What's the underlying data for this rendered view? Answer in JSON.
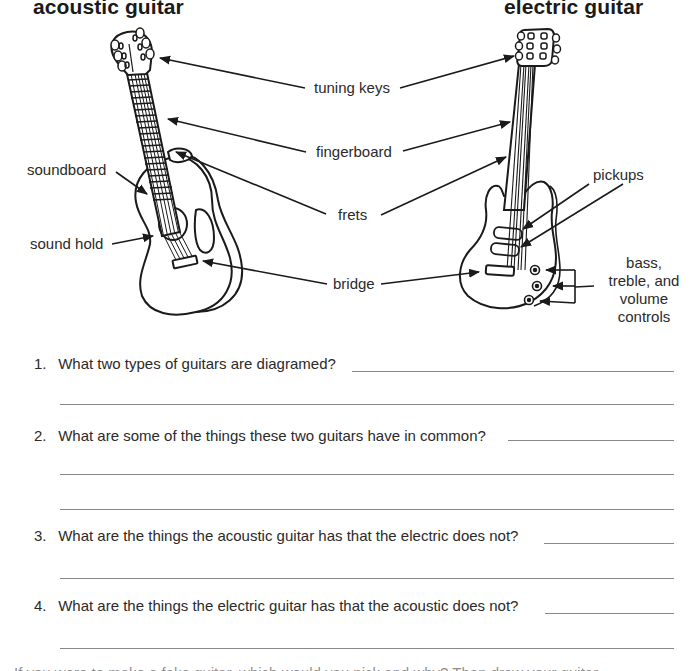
{
  "titles": {
    "acoustic": "acoustic guitar",
    "electric": "electric guitar"
  },
  "diagram": {
    "center_labels": [
      {
        "id": "tuning-keys",
        "text": "tuning keys"
      },
      {
        "id": "fingerboard",
        "text": "fingerboard"
      },
      {
        "id": "frets",
        "text": "frets"
      },
      {
        "id": "bridge",
        "text": "bridge"
      }
    ],
    "acoustic_labels": [
      {
        "id": "soundboard",
        "text": "soundboard"
      },
      {
        "id": "sound-hold",
        "text": "sound hold"
      }
    ],
    "electric_labels": [
      {
        "id": "pickups",
        "text": "pickups"
      },
      {
        "id": "controls",
        "lines": [
          "bass,",
          "treble, and",
          "volume",
          "controls"
        ]
      }
    ],
    "line_color": "#1a1a1a"
  },
  "questions": [
    {
      "number": "1.",
      "text": "What two types of guitars are diagramed?",
      "answer_lines": 2
    },
    {
      "number": "2.",
      "text": "What are some of the things these two guitars have in common?",
      "answer_lines": 3
    },
    {
      "number": "3.",
      "text": "What are the things the acoustic guitar has that the electric does not?",
      "answer_lines": 2
    },
    {
      "number": "4.",
      "text": "What are the things the electric guitar has that the acoustic does not?",
      "answer_lines": 2
    }
  ],
  "footer_cut_text": "If you were to make a fake guitar, which would you pick and why? Then draw your guitar."
}
